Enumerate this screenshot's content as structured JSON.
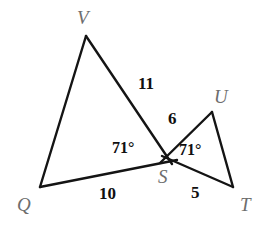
{
  "figure": {
    "background_color": "#ffffff",
    "stroke_color": "#141414",
    "vertex_label_color": "#6d6d6d",
    "measure_label_color": "#101010",
    "stroke_width": 2.4,
    "width": 271,
    "height": 228
  },
  "points": {
    "V": {
      "label": "V",
      "x": 86,
      "y": 36,
      "label_x": 77,
      "label_y": 8
    },
    "Q": {
      "label": "Q",
      "x": 40,
      "y": 187,
      "label_x": 17,
      "label_y": 195
    },
    "S": {
      "label": "S",
      "x": 167,
      "y": 159,
      "label_x": 158,
      "label_y": 167
    },
    "U": {
      "label": "U",
      "x": 212,
      "y": 112,
      "label_x": 214,
      "label_y": 87
    },
    "T": {
      "label": "T",
      "x": 233,
      "y": 187,
      "label_x": 240,
      "label_y": 195
    }
  },
  "segments": [
    {
      "name": "QV",
      "from": "Q",
      "to": "V",
      "length_label": ""
    },
    {
      "name": "VS",
      "from": "V",
      "to": "S",
      "length_label": "11"
    },
    {
      "name": "QS",
      "from": "Q",
      "to": "S",
      "length_label": "10"
    },
    {
      "name": "SU",
      "from": "S",
      "to": "U",
      "length_label": "6"
    },
    {
      "name": "ST",
      "from": "S",
      "to": "T",
      "length_label": "5"
    },
    {
      "name": "UT",
      "from": "U",
      "to": "T",
      "length_label": ""
    }
  ],
  "side_labels": [
    {
      "name": "side-label-vs",
      "text": "11",
      "x": 138,
      "y": 75
    },
    {
      "name": "side-label-su",
      "text": "6",
      "x": 168,
      "y": 110
    },
    {
      "name": "side-label-qs",
      "text": "10",
      "x": 99,
      "y": 185
    },
    {
      "name": "side-label-st",
      "text": "5",
      "x": 191,
      "y": 184
    }
  ],
  "angle_labels": [
    {
      "name": "angle-label-qsv",
      "text": "71°",
      "x": 112,
      "y": 140
    },
    {
      "name": "angle-label-ust",
      "text": "71°",
      "x": 179,
      "y": 142
    }
  ]
}
